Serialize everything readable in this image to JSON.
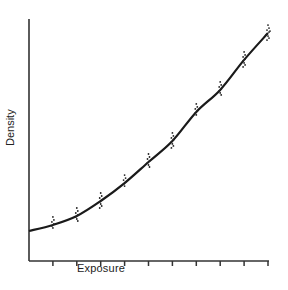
{
  "chart_data": {
    "type": "line",
    "title": "",
    "xlabel": "Exposure",
    "ylabel": "Density",
    "x_ticks": [
      0,
      1,
      2,
      3,
      4,
      5,
      6,
      7,
      8,
      9,
      10
    ],
    "x_tick_labels": [],
    "y_tick_labels": [],
    "xlim": [
      0,
      10
    ],
    "ylim": [
      0,
      100
    ],
    "grid": false,
    "legend": null,
    "series": [
      {
        "name": "fitted curve",
        "style": "solid line",
        "x": [
          0,
          1,
          2,
          3,
          4,
          5,
          6,
          7,
          8,
          9,
          10
        ],
        "y": [
          12.4,
          14.9,
          18.6,
          24.8,
          32.2,
          40.9,
          49.6,
          61.6,
          70.7,
          83.1,
          94.2
        ]
      },
      {
        "name": "measured points (clusters)",
        "style": "scatter",
        "x": [
          1,
          2,
          3,
          4,
          5,
          6,
          7,
          8,
          9,
          10
        ],
        "y": [
          14.9,
          18.6,
          24.8,
          32.2,
          40.9,
          49.6,
          61.6,
          70.7,
          83.1,
          94.2
        ]
      }
    ],
    "annotations": []
  },
  "labels": {
    "x_axis": "Exposure",
    "y_axis": "Density"
  },
  "colors": {
    "line": "#1a1a1a",
    "axis": "#333333",
    "background": "#ffffff"
  }
}
